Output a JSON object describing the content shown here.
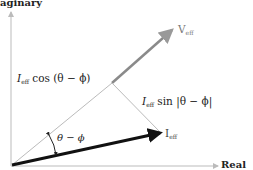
{
  "axes": {
    "y_label": "Imaginary",
    "y_label_visible": "aginary",
    "x_label": "Real"
  },
  "vectors": {
    "v_eff": {
      "label": "V",
      "sub": "eff",
      "color": "#8a8a8a"
    },
    "i_eff": {
      "label": "I",
      "sub": "eff",
      "color": "#111111"
    }
  },
  "annotations": {
    "cos_term": {
      "I": "I",
      "sub": "eff",
      "text": " cos (θ − ϕ)"
    },
    "sin_term": {
      "I": "I",
      "sub": "eff",
      "text": " sin |θ − ϕ|"
    },
    "angle": "θ − ϕ"
  }
}
